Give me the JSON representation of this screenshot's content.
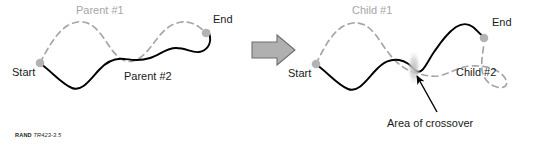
{
  "figure": {
    "title_semantic": "genetic-algorithm-crossover-diagram",
    "background_color": "#ffffff",
    "colors": {
      "solid_path": "#000000",
      "dashed_path": "#a6a6a6",
      "endpoint_dot": "#b3b3b3",
      "arrow_fill": "#b0b0b0",
      "arrow_stroke": "#6e6e6e",
      "crossover_blob": "#c9c9c9",
      "label_dark": "#1a1a1a",
      "label_gray": "#a6a6a6"
    },
    "left_panel": {
      "name": "parents-panel",
      "start_label": "Start",
      "end_label": "End",
      "dashed_curve_label": "Parent #1",
      "solid_curve_label": "Parent #2"
    },
    "transition": {
      "name": "process-arrow",
      "direction": "right"
    },
    "right_panel": {
      "name": "children-panel",
      "start_label": "Start",
      "end_label": "End",
      "dashed_curve_label": "Child #1",
      "solid_curve_label": "Child #2",
      "annotation_label": "Area of crossover"
    },
    "credit": {
      "org": "RAND",
      "number": "TR423-3.5"
    }
  }
}
